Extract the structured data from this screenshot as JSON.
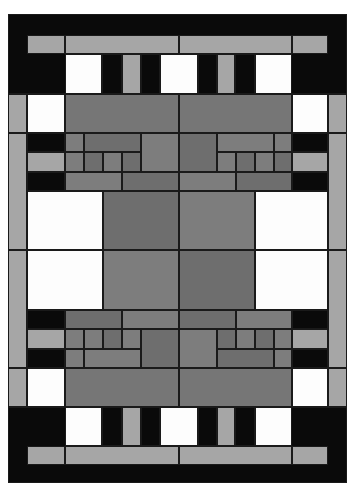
{
  "artwork": {
    "type": "geometric quilt pattern",
    "palette": {
      "black": "#0a0a0a",
      "white": "#fdfdfd",
      "light_gray": "#a6a6a6",
      "medium_gray": "#7d7d7d",
      "dark_gray": "#6e6e6e"
    },
    "bounds": {
      "x": 8,
      "y": 14,
      "width": 339,
      "height": 469
    },
    "symmetry": "bilateral (horizontal and vertical)"
  },
  "rects": [
    {
      "x": 8,
      "y": 14,
      "w": 339,
      "h": 80,
      "c": "bk"
    },
    {
      "x": 27,
      "y": 35,
      "w": 38,
      "h": 19,
      "c": "lg"
    },
    {
      "x": 65,
      "y": 35,
      "w": 114,
      "h": 19,
      "c": "lg"
    },
    {
      "x": 179,
      "y": 35,
      "w": 113,
      "h": 19,
      "c": "lg"
    },
    {
      "x": 292,
      "y": 35,
      "w": 36,
      "h": 19,
      "c": "lg"
    },
    {
      "x": 65,
      "y": 54,
      "w": 37,
      "h": 40,
      "c": "wh"
    },
    {
      "x": 102,
      "y": 54,
      "w": 20,
      "h": 40,
      "c": "bk"
    },
    {
      "x": 122,
      "y": 54,
      "w": 19,
      "h": 40,
      "c": "lg"
    },
    {
      "x": 141,
      "y": 54,
      "w": 19,
      "h": 40,
      "c": "bk"
    },
    {
      "x": 160,
      "y": 54,
      "w": 38,
      "h": 40,
      "c": "wh"
    },
    {
      "x": 198,
      "y": 54,
      "w": 19,
      "h": 40,
      "c": "bk"
    },
    {
      "x": 217,
      "y": 54,
      "w": 18,
      "h": 40,
      "c": "lg"
    },
    {
      "x": 235,
      "y": 54,
      "w": 20,
      "h": 40,
      "c": "bk"
    },
    {
      "x": 255,
      "y": 54,
      "w": 37,
      "h": 40,
      "c": "wh"
    },
    {
      "x": 8,
      "y": 94,
      "w": 19,
      "h": 39,
      "c": "lg"
    },
    {
      "x": 27,
      "y": 94,
      "w": 38,
      "h": 39,
      "c": "wh"
    },
    {
      "x": 65,
      "y": 94,
      "w": 114,
      "h": 39,
      "c": "md"
    },
    {
      "x": 179,
      "y": 94,
      "w": 113,
      "h": 39,
      "c": "md"
    },
    {
      "x": 292,
      "y": 94,
      "w": 36,
      "h": 39,
      "c": "wh"
    },
    {
      "x": 328,
      "y": 94,
      "w": 19,
      "h": 39,
      "c": "lg"
    },
    {
      "x": 8,
      "y": 133,
      "w": 19,
      "h": 117,
      "c": "lg"
    },
    {
      "x": 328,
      "y": 133,
      "w": 19,
      "h": 117,
      "c": "lg"
    },
    {
      "x": 27,
      "y": 133,
      "w": 38,
      "h": 19,
      "c": "bk"
    },
    {
      "x": 27,
      "y": 152,
      "w": 38,
      "h": 20,
      "c": "lg"
    },
    {
      "x": 27,
      "y": 172,
      "w": 38,
      "h": 19,
      "c": "bk"
    },
    {
      "x": 292,
      "y": 133,
      "w": 36,
      "h": 19,
      "c": "bk"
    },
    {
      "x": 292,
      "y": 152,
      "w": 36,
      "h": 20,
      "c": "lg"
    },
    {
      "x": 292,
      "y": 172,
      "w": 36,
      "h": 19,
      "c": "bk"
    },
    {
      "x": 65,
      "y": 133,
      "w": 19,
      "h": 19,
      "c": "mg"
    },
    {
      "x": 84,
      "y": 133,
      "w": 57,
      "h": 19,
      "c": "dg"
    },
    {
      "x": 141,
      "y": 133,
      "w": 38,
      "h": 39,
      "c": "mg"
    },
    {
      "x": 65,
      "y": 152,
      "w": 19,
      "h": 20,
      "c": "mg"
    },
    {
      "x": 84,
      "y": 152,
      "w": 19,
      "h": 20,
      "c": "dg"
    },
    {
      "x": 103,
      "y": 152,
      "w": 19,
      "h": 20,
      "c": "mg"
    },
    {
      "x": 122,
      "y": 152,
      "w": 19,
      "h": 20,
      "c": "dg"
    },
    {
      "x": 65,
      "y": 172,
      "w": 57,
      "h": 19,
      "c": "mg"
    },
    {
      "x": 122,
      "y": 172,
      "w": 57,
      "h": 19,
      "c": "dg"
    },
    {
      "x": 179,
      "y": 133,
      "w": 38,
      "h": 39,
      "c": "dg"
    },
    {
      "x": 217,
      "y": 133,
      "w": 57,
      "h": 19,
      "c": "mg"
    },
    {
      "x": 274,
      "y": 133,
      "w": 18,
      "h": 19,
      "c": "mg"
    },
    {
      "x": 217,
      "y": 152,
      "w": 19,
      "h": 20,
      "c": "mg"
    },
    {
      "x": 236,
      "y": 152,
      "w": 19,
      "h": 20,
      "c": "dg"
    },
    {
      "x": 255,
      "y": 152,
      "w": 19,
      "h": 20,
      "c": "mg"
    },
    {
      "x": 274,
      "y": 152,
      "w": 18,
      "h": 20,
      "c": "dg"
    },
    {
      "x": 179,
      "y": 172,
      "w": 57,
      "h": 19,
      "c": "mg"
    },
    {
      "x": 236,
      "y": 172,
      "w": 56,
      "h": 19,
      "c": "dg"
    },
    {
      "x": 27,
      "y": 191,
      "w": 76,
      "h": 59,
      "c": "wh"
    },
    {
      "x": 103,
      "y": 191,
      "w": 76,
      "h": 59,
      "c": "dg"
    },
    {
      "x": 179,
      "y": 191,
      "w": 76,
      "h": 59,
      "c": "mg"
    },
    {
      "x": 255,
      "y": 191,
      "w": 73,
      "h": 59,
      "c": "wh"
    },
    {
      "x": 8,
      "y": 250,
      "w": 19,
      "h": 118,
      "c": "lg"
    },
    {
      "x": 328,
      "y": 250,
      "w": 19,
      "h": 118,
      "c": "lg"
    },
    {
      "x": 27,
      "y": 250,
      "w": 76,
      "h": 60,
      "c": "wh"
    },
    {
      "x": 103,
      "y": 250,
      "w": 76,
      "h": 60,
      "c": "mg"
    },
    {
      "x": 179,
      "y": 250,
      "w": 76,
      "h": 60,
      "c": "dg"
    },
    {
      "x": 255,
      "y": 250,
      "w": 73,
      "h": 60,
      "c": "wh"
    },
    {
      "x": 27,
      "y": 310,
      "w": 38,
      "h": 19,
      "c": "bk"
    },
    {
      "x": 27,
      "y": 329,
      "w": 38,
      "h": 20,
      "c": "lg"
    },
    {
      "x": 27,
      "y": 349,
      "w": 38,
      "h": 19,
      "c": "bk"
    },
    {
      "x": 292,
      "y": 310,
      "w": 36,
      "h": 19,
      "c": "bk"
    },
    {
      "x": 292,
      "y": 329,
      "w": 36,
      "h": 20,
      "c": "lg"
    },
    {
      "x": 292,
      "y": 349,
      "w": 36,
      "h": 19,
      "c": "bk"
    },
    {
      "x": 65,
      "y": 310,
      "w": 57,
      "h": 19,
      "c": "dg"
    },
    {
      "x": 122,
      "y": 310,
      "w": 57,
      "h": 19,
      "c": "mg"
    },
    {
      "x": 65,
      "y": 329,
      "w": 19,
      "h": 20,
      "c": "mg"
    },
    {
      "x": 84,
      "y": 329,
      "w": 19,
      "h": 20,
      "c": "mg"
    },
    {
      "x": 103,
      "y": 329,
      "w": 19,
      "h": 20,
      "c": "dg"
    },
    {
      "x": 122,
      "y": 329,
      "w": 19,
      "h": 20,
      "c": "mg"
    },
    {
      "x": 141,
      "y": 329,
      "w": 38,
      "h": 39,
      "c": "dg"
    },
    {
      "x": 65,
      "y": 349,
      "w": 19,
      "h": 19,
      "c": "mg"
    },
    {
      "x": 84,
      "y": 349,
      "w": 57,
      "h": 19,
      "c": "mg"
    },
    {
      "x": 179,
      "y": 310,
      "w": 57,
      "h": 19,
      "c": "dg"
    },
    {
      "x": 236,
      "y": 310,
      "w": 56,
      "h": 19,
      "c": "mg"
    },
    {
      "x": 179,
      "y": 329,
      "w": 38,
      "h": 39,
      "c": "mg"
    },
    {
      "x": 217,
      "y": 329,
      "w": 19,
      "h": 20,
      "c": "dg"
    },
    {
      "x": 236,
      "y": 329,
      "w": 19,
      "h": 20,
      "c": "mg"
    },
    {
      "x": 255,
      "y": 329,
      "w": 19,
      "h": 20,
      "c": "dg"
    },
    {
      "x": 274,
      "y": 329,
      "w": 18,
      "h": 20,
      "c": "mg"
    },
    {
      "x": 217,
      "y": 349,
      "w": 57,
      "h": 19,
      "c": "dg"
    },
    {
      "x": 274,
      "y": 349,
      "w": 18,
      "h": 19,
      "c": "mg"
    },
    {
      "x": 8,
      "y": 368,
      "w": 19,
      "h": 39,
      "c": "lg"
    },
    {
      "x": 27,
      "y": 368,
      "w": 38,
      "h": 39,
      "c": "wh"
    },
    {
      "x": 65,
      "y": 368,
      "w": 114,
      "h": 39,
      "c": "md"
    },
    {
      "x": 179,
      "y": 368,
      "w": 113,
      "h": 39,
      "c": "md"
    },
    {
      "x": 292,
      "y": 368,
      "w": 36,
      "h": 39,
      "c": "wh"
    },
    {
      "x": 328,
      "y": 368,
      "w": 19,
      "h": 39,
      "c": "lg"
    },
    {
      "x": 8,
      "y": 407,
      "w": 339,
      "h": 76,
      "c": "bk"
    },
    {
      "x": 65,
      "y": 407,
      "w": 37,
      "h": 39,
      "c": "wh"
    },
    {
      "x": 102,
      "y": 407,
      "w": 20,
      "h": 39,
      "c": "bk"
    },
    {
      "x": 122,
      "y": 407,
      "w": 19,
      "h": 39,
      "c": "lg"
    },
    {
      "x": 141,
      "y": 407,
      "w": 19,
      "h": 39,
      "c": "bk"
    },
    {
      "x": 160,
      "y": 407,
      "w": 38,
      "h": 39,
      "c": "wh"
    },
    {
      "x": 198,
      "y": 407,
      "w": 19,
      "h": 39,
      "c": "bk"
    },
    {
      "x": 217,
      "y": 407,
      "w": 18,
      "h": 39,
      "c": "lg"
    },
    {
      "x": 235,
      "y": 407,
      "w": 20,
      "h": 39,
      "c": "bk"
    },
    {
      "x": 255,
      "y": 407,
      "w": 37,
      "h": 39,
      "c": "wh"
    },
    {
      "x": 27,
      "y": 446,
      "w": 38,
      "h": 19,
      "c": "lg"
    },
    {
      "x": 65,
      "y": 446,
      "w": 114,
      "h": 19,
      "c": "lg"
    },
    {
      "x": 179,
      "y": 446,
      "w": 113,
      "h": 19,
      "c": "lg"
    },
    {
      "x": 292,
      "y": 446,
      "w": 36,
      "h": 19,
      "c": "lg"
    }
  ]
}
